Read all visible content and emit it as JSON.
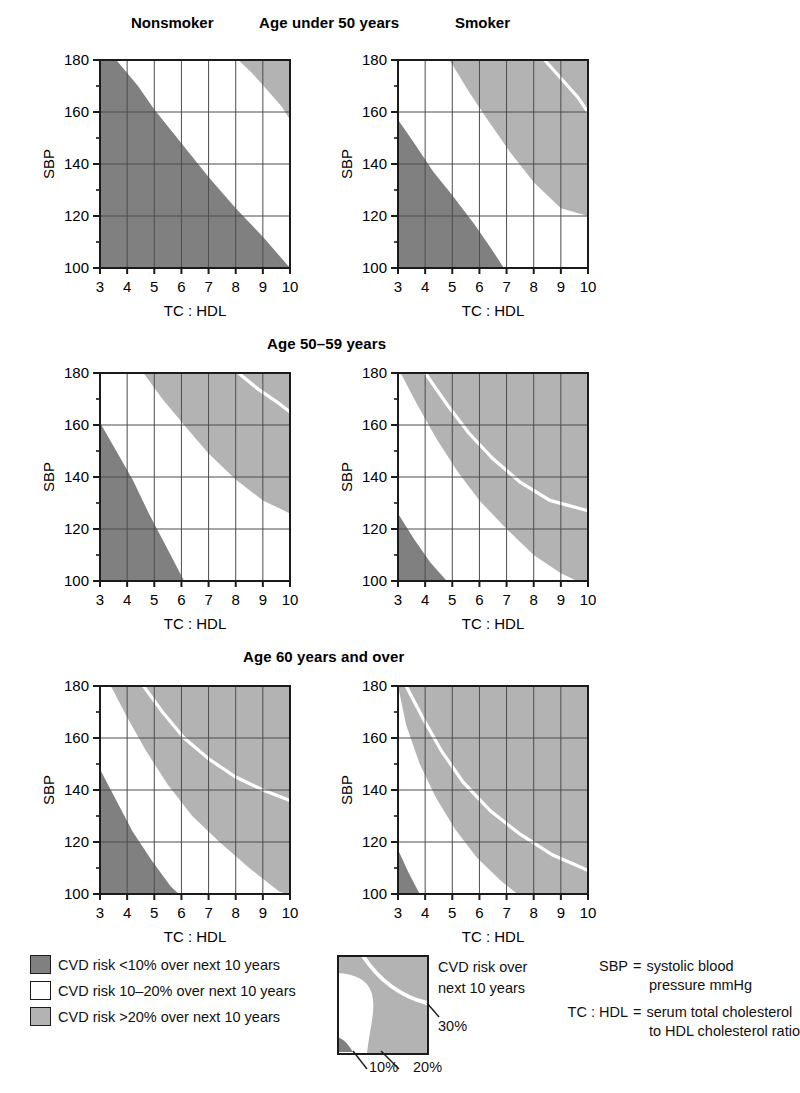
{
  "figure": {
    "column_labels": [
      "Nonsmoker",
      "Smoker"
    ],
    "row_titles": [
      "Age under 50 years",
      "Age 50–59 years",
      "Age 60 years and over"
    ],
    "x_axis_title": "TC : HDL",
    "y_axis_title": "SBP",
    "x_ticks": [
      "3",
      "4",
      "5",
      "6",
      "7",
      "8",
      "9",
      "10"
    ],
    "y_ticks": [
      "100",
      "120",
      "140",
      "160",
      "180"
    ]
  },
  "colors": {
    "low": "#808080",
    "moderate": "#ffffff",
    "high": "#b3b3b3",
    "axis": "#1b1b1b",
    "grid": "#4d4d4d",
    "contour": "#ffffff",
    "text": "#111111"
  },
  "legend": {
    "items": [
      {
        "swatch": "low",
        "label": "CVD risk <10% over next 10 years"
      },
      {
        "swatch": "moderate",
        "label": "CVD risk 10–20% over next 10 years"
      },
      {
        "swatch": "high",
        "label": "CVD risk >20% over next 10 years"
      }
    ]
  },
  "detail_legend": {
    "caption_line1": "CVD risk over",
    "caption_line2": "next 10 years",
    "label_30": "30%",
    "label_10": "10%",
    "label_20": "20%"
  },
  "abbreviations": [
    {
      "key": "SBP",
      "eq": "=",
      "value": "systolic blood",
      "cont": "pressure mmHg"
    },
    {
      "key": "TC : HDL",
      "eq": "=",
      "value": "serum total cholesterol",
      "cont": "to HDL cholesterol ratio"
    }
  ],
  "chart_data": {
    "type": "heatmap",
    "xlabel": "TC : HDL",
    "ylabel": "SBP",
    "xlim": [
      3,
      10
    ],
    "ylim": [
      100,
      180
    ],
    "grid": true,
    "legend_position": "bottom",
    "bands": [
      {
        "name": "CVD risk <10% over next 10 years",
        "color": "#808080"
      },
      {
        "name": "CVD risk 10–20% over next 10 years",
        "color": "#ffffff"
      },
      {
        "name": "CVD risk >20% over next 10 years",
        "color": "#b3b3b3"
      }
    ],
    "contour_labels": [
      "10%",
      "20%",
      "30%"
    ],
    "panels": [
      {
        "row": "Age under 50 years",
        "column": "Nonsmoker",
        "contour_10": [
          {
            "x": 3.0,
            "y": 180
          },
          {
            "x": 3.6,
            "y": 180
          },
          {
            "x": 4.4,
            "y": 170
          },
          {
            "x": 5.0,
            "y": 161
          },
          {
            "x": 6.0,
            "y": 148
          },
          {
            "x": 7.0,
            "y": 135
          },
          {
            "x": 8.0,
            "y": 123
          },
          {
            "x": 9.0,
            "y": 112
          },
          {
            "x": 10.0,
            "y": 100
          }
        ],
        "contour_20": [
          {
            "x": 8.1,
            "y": 180
          },
          {
            "x": 8.6,
            "y": 175
          },
          {
            "x": 9.2,
            "y": 168
          },
          {
            "x": 9.7,
            "y": 162
          },
          {
            "x": 10.0,
            "y": 157
          }
        ],
        "contour_30": []
      },
      {
        "row": "Age under 50 years",
        "column": "Smoker",
        "contour_10": [
          {
            "x": 3.0,
            "y": 157
          },
          {
            "x": 3.6,
            "y": 148
          },
          {
            "x": 4.3,
            "y": 137
          },
          {
            "x": 5.0,
            "y": 128
          },
          {
            "x": 5.8,
            "y": 117
          },
          {
            "x": 6.4,
            "y": 108
          },
          {
            "x": 6.9,
            "y": 100
          }
        ],
        "contour_20": [
          {
            "x": 4.9,
            "y": 180
          },
          {
            "x": 5.6,
            "y": 168
          },
          {
            "x": 6.3,
            "y": 157
          },
          {
            "x": 7.1,
            "y": 145
          },
          {
            "x": 8.0,
            "y": 133
          },
          {
            "x": 9.0,
            "y": 123
          },
          {
            "x": 10.0,
            "y": 120
          }
        ],
        "contour_30": [
          {
            "x": 8.4,
            "y": 180
          },
          {
            "x": 9.0,
            "y": 173
          },
          {
            "x": 9.6,
            "y": 166
          },
          {
            "x": 10.0,
            "y": 160
          }
        ]
      },
      {
        "row": "Age 50–59 years",
        "column": "Nonsmoker",
        "contour_10": [
          {
            "x": 3.0,
            "y": 161
          },
          {
            "x": 3.6,
            "y": 150
          },
          {
            "x": 4.2,
            "y": 139
          },
          {
            "x": 4.8,
            "y": 126
          },
          {
            "x": 5.4,
            "y": 114
          },
          {
            "x": 6.1,
            "y": 100
          }
        ],
        "contour_20": [
          {
            "x": 4.6,
            "y": 180
          },
          {
            "x": 5.3,
            "y": 170
          },
          {
            "x": 6.1,
            "y": 160
          },
          {
            "x": 7.0,
            "y": 149
          },
          {
            "x": 8.0,
            "y": 139
          },
          {
            "x": 9.0,
            "y": 131
          },
          {
            "x": 10.0,
            "y": 126
          }
        ],
        "contour_30": [
          {
            "x": 8.1,
            "y": 180
          },
          {
            "x": 8.8,
            "y": 174
          },
          {
            "x": 9.5,
            "y": 169
          },
          {
            "x": 10.0,
            "y": 165
          }
        ]
      },
      {
        "row": "Age 50–59 years",
        "column": "Smoker",
        "contour_10": [
          {
            "x": 3.0,
            "y": 126
          },
          {
            "x": 3.6,
            "y": 116
          },
          {
            "x": 4.2,
            "y": 107
          },
          {
            "x": 4.8,
            "y": 100
          }
        ],
        "contour_20": [
          {
            "x": 3.1,
            "y": 180
          },
          {
            "x": 3.7,
            "y": 168
          },
          {
            "x": 4.4,
            "y": 155
          },
          {
            "x": 5.2,
            "y": 142
          },
          {
            "x": 6.0,
            "y": 131
          },
          {
            "x": 7.0,
            "y": 120
          },
          {
            "x": 8.0,
            "y": 110
          },
          {
            "x": 9.0,
            "y": 103
          },
          {
            "x": 9.6,
            "y": 100
          }
        ],
        "contour_30": [
          {
            "x": 4.0,
            "y": 180
          },
          {
            "x": 4.8,
            "y": 168
          },
          {
            "x": 5.6,
            "y": 157
          },
          {
            "x": 6.5,
            "y": 147
          },
          {
            "x": 7.5,
            "y": 138
          },
          {
            "x": 8.6,
            "y": 131
          },
          {
            "x": 10.0,
            "y": 127
          }
        ]
      },
      {
        "row": "Age 60 years and over",
        "column": "Nonsmoker",
        "contour_10": [
          {
            "x": 3.0,
            "y": 148
          },
          {
            "x": 3.6,
            "y": 136
          },
          {
            "x": 4.2,
            "y": 124
          },
          {
            "x": 4.9,
            "y": 113
          },
          {
            "x": 5.6,
            "y": 103
          },
          {
            "x": 5.9,
            "y": 100
          }
        ],
        "contour_20": [
          {
            "x": 3.4,
            "y": 180
          },
          {
            "x": 4.0,
            "y": 168
          },
          {
            "x": 4.7,
            "y": 155
          },
          {
            "x": 5.5,
            "y": 142
          },
          {
            "x": 6.4,
            "y": 130
          },
          {
            "x": 7.4,
            "y": 120
          },
          {
            "x": 8.5,
            "y": 110
          },
          {
            "x": 9.6,
            "y": 101
          },
          {
            "x": 9.9,
            "y": 100
          }
        ],
        "contour_30": [
          {
            "x": 4.6,
            "y": 180
          },
          {
            "x": 5.3,
            "y": 170
          },
          {
            "x": 6.1,
            "y": 160
          },
          {
            "x": 7.0,
            "y": 152
          },
          {
            "x": 8.0,
            "y": 145
          },
          {
            "x": 9.0,
            "y": 140
          },
          {
            "x": 10.0,
            "y": 136
          }
        ]
      },
      {
        "row": "Age 60 years and over",
        "column": "Smoker",
        "contour_10": [
          {
            "x": 3.0,
            "y": 117
          },
          {
            "x": 3.4,
            "y": 108
          },
          {
            "x": 3.8,
            "y": 100
          }
        ],
        "contour_20": [
          {
            "x": 3.0,
            "y": 180
          },
          {
            "x": 3.3,
            "y": 165
          },
          {
            "x": 3.8,
            "y": 150
          },
          {
            "x": 4.4,
            "y": 137
          },
          {
            "x": 5.1,
            "y": 125
          },
          {
            "x": 5.9,
            "y": 114
          },
          {
            "x": 6.8,
            "y": 105
          },
          {
            "x": 7.4,
            "y": 100
          }
        ],
        "contour_30": [
          {
            "x": 3.3,
            "y": 180
          },
          {
            "x": 3.9,
            "y": 168
          },
          {
            "x": 4.6,
            "y": 155
          },
          {
            "x": 5.4,
            "y": 143
          },
          {
            "x": 6.4,
            "y": 132
          },
          {
            "x": 7.5,
            "y": 123
          },
          {
            "x": 8.7,
            "y": 115
          },
          {
            "x": 9.8,
            "y": 110
          },
          {
            "x": 10.0,
            "y": 109
          }
        ]
      }
    ]
  }
}
